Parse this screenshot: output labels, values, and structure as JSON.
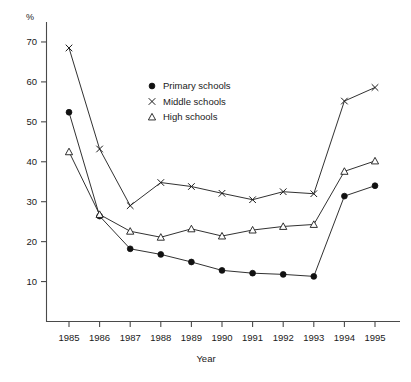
{
  "chart_data": {
    "type": "line",
    "title": "",
    "xlabel": "Year",
    "ylabel": "%",
    "categories": [
      "1985",
      "1986",
      "1987",
      "1988",
      "1989",
      "1990",
      "1991",
      "1992",
      "1993",
      "1994",
      "1995"
    ],
    "x": [
      1985,
      1986,
      1987,
      1988,
      1989,
      1990,
      1991,
      1992,
      1993,
      1994,
      1995
    ],
    "series": [
      {
        "name": "Primary schools",
        "marker": "filled-circle",
        "values": [
          52.4,
          26.4,
          18.2,
          16.8,
          14.9,
          12.8,
          12.1,
          11.8,
          11.3,
          31.4,
          34.0
        ]
      },
      {
        "name": "Middle schools",
        "marker": "cross",
        "values": [
          68.5,
          43.2,
          29.0,
          34.8,
          33.8,
          32.1,
          30.5,
          32.5,
          32.0,
          55.2,
          58.6
        ]
      },
      {
        "name": "High schools",
        "marker": "open-triangle",
        "values": [
          42.5,
          26.8,
          22.6,
          21.1,
          23.2,
          21.4,
          22.9,
          23.8,
          24.3,
          37.6,
          40.2
        ]
      }
    ],
    "ylim": [
      0,
      75
    ],
    "yticks": [
      10,
      20,
      30,
      40,
      50,
      60,
      70
    ],
    "ytick_labels": [
      "10",
      "20",
      "30",
      "40",
      "50",
      "60",
      "70"
    ],
    "grid": false,
    "legend_position": "upper-center"
  },
  "legend": {
    "items": [
      {
        "label": "Primary schools",
        "marker": "filled-circle"
      },
      {
        "label": "Middle schools",
        "marker": "cross"
      },
      {
        "label": "High schools",
        "marker": "open-triangle"
      }
    ]
  },
  "axes": {
    "y_unit_label": "%",
    "x_axis_title": "Year"
  }
}
